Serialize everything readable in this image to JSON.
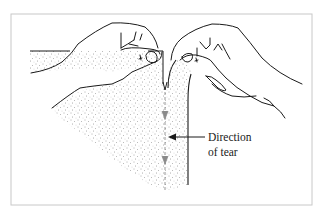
{
  "figure": {
    "label": {
      "line1": "Direction",
      "line2": "of tear"
    },
    "icons": [
      "left-hand-icon",
      "right-hand-icon",
      "paper-sheet-icon",
      "tear-line-icon",
      "direction-arrow-icon"
    ],
    "colors": {
      "line": "#1a1a1a",
      "frame": "#c8c8c8",
      "stipple": "#555555",
      "tear": "#8a8a8a",
      "background": "#ffffff"
    }
  }
}
